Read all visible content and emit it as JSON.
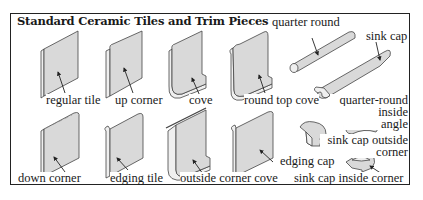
{
  "diagram": {
    "title": "Standard Ceramic Tiles and Trim Pieces",
    "labels": {
      "regular_tile": "regular tile",
      "up_corner": "up corner",
      "cove": "cove",
      "round_top_cove": "round top cove",
      "quarter_round": "quarter round",
      "sink_cap": "sink cap",
      "quarter_round_inside_angle_1": "quarter-round",
      "quarter_round_inside_angle_2": "inside",
      "quarter_round_inside_angle_3": "angle",
      "down_corner": "down corner",
      "edging_tile": "edging tile",
      "outside_corner_cove": "outside corner cove",
      "edging_cap": "edging cap",
      "sink_cap_outside_corner_1": "sink cap outside",
      "sink_cap_outside_corner_2": "corner",
      "sink_cap_inside_corner": "sink cap inside corner"
    }
  }
}
